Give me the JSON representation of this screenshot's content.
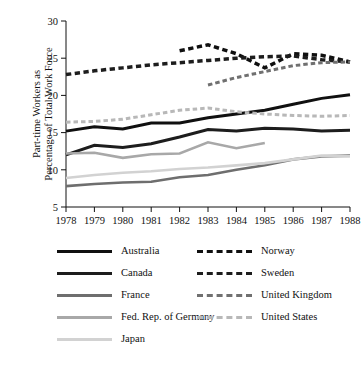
{
  "chart_data": {
    "type": "line",
    "title": "",
    "subtitle": "",
    "xlabel": "",
    "ylabel": "Part-time Workers as Percentage of Total Work Force",
    "ylabel_line1": "Part-time Workers as",
    "ylabel_line2": "Percentage of Total Work Force",
    "x": [
      1978,
      1979,
      1980,
      1981,
      1982,
      1983,
      1984,
      1985,
      1986,
      1987,
      1988
    ],
    "xtick_labels": [
      "1978",
      "1979",
      "1980",
      "1981",
      "1982",
      "1983",
      "1984",
      "1985",
      "1986",
      "1987",
      "1988"
    ],
    "ytick_labels": [
      "5",
      "10",
      "15",
      "20",
      "25",
      "30"
    ],
    "yticks": [
      5,
      10,
      15,
      20,
      25,
      30
    ],
    "xlim": [
      1978,
      1988
    ],
    "ylim": [
      5,
      30
    ],
    "grid": false,
    "legend_position": "below",
    "series": [
      {
        "name": "Australia",
        "style": "solid",
        "color": "#101010",
        "width": 3.0,
        "x": [
          1978,
          1979,
          1980,
          1981,
          1982,
          1983,
          1984,
          1985,
          1986,
          1987,
          1988
        ],
        "values": [
          15.2,
          15.8,
          15.5,
          16.3,
          16.3,
          17.0,
          17.5,
          18.0,
          18.8,
          19.6,
          20.1
        ]
      },
      {
        "name": "Canada",
        "style": "solid",
        "color": "#1d1d1d",
        "width": 3.0,
        "x": [
          1978,
          1979,
          1980,
          1981,
          1982,
          1983,
          1984,
          1985,
          1986,
          1987,
          1988
        ],
        "values": [
          12.0,
          13.3,
          13.0,
          13.5,
          14.4,
          15.4,
          15.2,
          15.6,
          15.5,
          15.2,
          15.3
        ]
      },
      {
        "name": "France",
        "style": "solid",
        "color": "#6e6e6e",
        "width": 2.6,
        "x": [
          1978,
          1979,
          1980,
          1981,
          1982,
          1983,
          1984,
          1985,
          1986,
          1987,
          1988
        ],
        "values": [
          7.8,
          8.1,
          8.3,
          8.4,
          9.0,
          9.3,
          10.0,
          10.6,
          11.4,
          11.8,
          11.9
        ]
      },
      {
        "name": "Fed. Rep. of Germany",
        "style": "solid",
        "color": "#a8a8a8",
        "width": 2.6,
        "x": [
          1978,
          1979,
          1980,
          1981,
          1982,
          1983,
          1984,
          1985
        ],
        "values": [
          12.2,
          12.3,
          11.6,
          12.1,
          12.2,
          13.7,
          12.9,
          13.6
        ]
      },
      {
        "name": "Japan",
        "style": "solid",
        "color": "#d2d2d2",
        "width": 2.6,
        "x": [
          1978,
          1979,
          1980,
          1981,
          1982,
          1983,
          1984,
          1985,
          1986,
          1987,
          1988
        ],
        "values": [
          8.9,
          9.3,
          9.6,
          9.8,
          10.1,
          10.3,
          10.6,
          10.9,
          11.4,
          11.9,
          11.8
        ]
      },
      {
        "name": "Norway",
        "style": "dashed",
        "color": "#101010",
        "width": 3.5,
        "x": [
          1982,
          1983,
          1984,
          1985,
          1986,
          1987,
          1988
        ],
        "values": [
          26.0,
          26.8,
          25.6,
          23.7,
          25.6,
          25.4,
          24.5
        ]
      },
      {
        "name": "Sweden",
        "style": "dashed",
        "color": "#1d1d1d",
        "width": 3.5,
        "x": [
          1978,
          1979,
          1980,
          1981,
          1982,
          1983,
          1984,
          1985,
          1986,
          1987,
          1988
        ],
        "values": [
          22.8,
          23.3,
          23.7,
          24.1,
          24.4,
          24.7,
          25.0,
          25.2,
          25.3,
          24.8,
          24.5
        ]
      },
      {
        "name": "United Kingdom",
        "style": "dashed",
        "color": "#707070",
        "width": 3.0,
        "x": [
          1983,
          1984,
          1985,
          1986,
          1987,
          1988
        ],
        "values": [
          21.4,
          22.4,
          23.2,
          24.0,
          24.4,
          24.5
        ]
      },
      {
        "name": "United States",
        "style": "dashed",
        "color": "#b8b8b8",
        "width": 3.0,
        "x": [
          1978,
          1979,
          1980,
          1981,
          1982,
          1983,
          1984,
          1985,
          1986,
          1987,
          1988
        ],
        "values": [
          16.4,
          16.5,
          16.8,
          17.4,
          18.0,
          18.3,
          17.8,
          17.5,
          17.3,
          17.2,
          17.3
        ]
      }
    ]
  },
  "legend": {
    "left_column": [
      {
        "label": "Australia",
        "color": "#101010",
        "style": "solid",
        "width": 3.2
      },
      {
        "label": "Canada",
        "color": "#1d1d1d",
        "style": "solid",
        "width": 3.2
      },
      {
        "label": "France",
        "color": "#6e6e6e",
        "style": "solid",
        "width": 3.0
      },
      {
        "label": "Fed. Rep. of Germany",
        "color": "#a8a8a8",
        "style": "solid",
        "width": 3.0
      },
      {
        "label": "Japan",
        "color": "#d2d2d2",
        "style": "solid",
        "width": 3.0
      }
    ],
    "right_column": [
      {
        "label": "Norway",
        "color": "#101010",
        "style": "dashed",
        "width": 3.5
      },
      {
        "label": "Sweden",
        "color": "#1d1d1d",
        "style": "dashed",
        "width": 3.5
      },
      {
        "label": "United Kingdom",
        "color": "#707070",
        "style": "dashed",
        "width": 3.2
      },
      {
        "label": "United States",
        "color": "#b8b8b8",
        "style": "dashed",
        "width": 3.2
      }
    ]
  }
}
